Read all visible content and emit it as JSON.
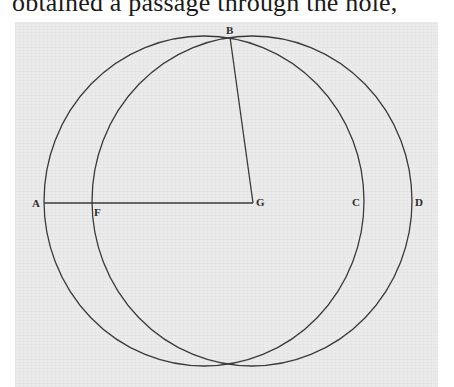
{
  "caption": {
    "text": "obtained a passage through the hole,"
  },
  "figure": {
    "labels": {
      "A": "A",
      "B": "B",
      "C": "C",
      "D": "D",
      "F": "F",
      "G": "G"
    },
    "stroke_color": "#3a3a3a",
    "background_color": "#ebebeb",
    "circles": [
      {
        "name": "circle-A-C",
        "cx": 204,
        "cy": 201,
        "rx": 160,
        "ry": 165
      },
      {
        "name": "circle-F-D",
        "cx": 252,
        "cy": 201,
        "rx": 160,
        "ry": 165
      }
    ],
    "segments": [
      {
        "name": "line-A-G",
        "from": "A",
        "to": "G"
      },
      {
        "name": "line-B-G",
        "from": "B",
        "to": "G"
      }
    ]
  }
}
